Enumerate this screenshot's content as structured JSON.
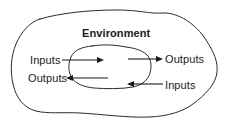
{
  "diagram": {
    "title": "Environment",
    "outer_region_name": "Environment",
    "inner_region_name": "System",
    "stroke_color": "#2b2b2b",
    "arrow_color": "#1a1a1a",
    "background_color": "#ffffff",
    "labels": {
      "environment": "Environment",
      "inputs_left": "Inputs",
      "outputs_left": "Outputs",
      "outputs_right": "Outputs",
      "inputs_right": "Inputs"
    },
    "flows": [
      {
        "name": "inputs-into-system-left",
        "label": "Inputs",
        "direction": "right",
        "from_x": 62,
        "to_x": 101,
        "y": 60
      },
      {
        "name": "outputs-from-system-left",
        "label": "Outputs",
        "direction": "left",
        "from_x": 108,
        "to_x": 68,
        "y": 78
      },
      {
        "name": "outputs-from-system-right",
        "label": "Outputs",
        "direction": "right",
        "from_x": 128,
        "to_x": 163,
        "y": 59
      },
      {
        "name": "inputs-into-system-right",
        "label": "Inputs",
        "direction": "left",
        "from_x": 163,
        "to_x": 127,
        "y": 84
      }
    ]
  }
}
